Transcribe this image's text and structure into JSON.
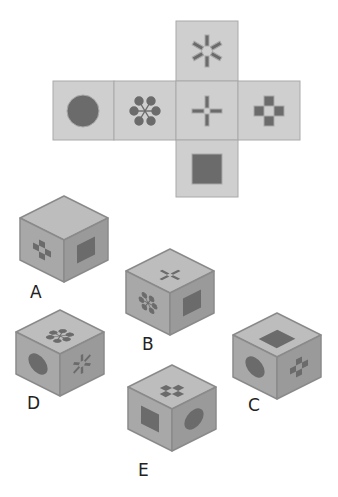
{
  "puzzle": {
    "type": "cube-net-folding",
    "colors": {
      "face": "#cfcfcf",
      "face_border": "#a9a9a9",
      "symbol": "#6b6b6b",
      "cube_top": "#bdbdbd",
      "cube_left": "#a8a8a8",
      "cube_right": "#9a9a9a",
      "cube_edge": "#8a8a8a"
    },
    "net": {
      "cells": [
        {
          "pos": "top",
          "symbol": "asterisk-bars"
        },
        {
          "pos": "left-2",
          "symbol": "circle"
        },
        {
          "pos": "left-1",
          "symbol": "node-star"
        },
        {
          "pos": "center",
          "symbol": "plus"
        },
        {
          "pos": "right",
          "symbol": "checker-cross"
        },
        {
          "pos": "bottom",
          "symbol": "square"
        }
      ]
    },
    "options": [
      {
        "label": "A",
        "top": "blank",
        "left": "checker-cross",
        "right": "square"
      },
      {
        "label": "B",
        "top": "plus",
        "left": "node-star",
        "right": "square"
      },
      {
        "label": "C",
        "top": "square",
        "left": "circle",
        "right": "checker-cross"
      },
      {
        "label": "D",
        "top": "node-star",
        "left": "circle",
        "right": "asterisk-bars"
      },
      {
        "label": "E",
        "top": "checker-cross",
        "left": "square",
        "right": "circle"
      }
    ]
  }
}
